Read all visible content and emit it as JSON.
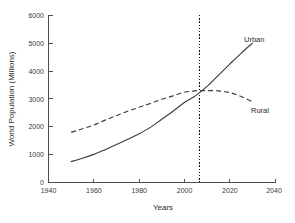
{
  "chart_data": {
    "type": "line",
    "title": "",
    "xlabel": "Years",
    "ylabel": "World Population (Millions)",
    "xlim": [
      1940,
      2040
    ],
    "ylim": [
      0,
      6000
    ],
    "xticks": [
      1940,
      1960,
      1980,
      2000,
      2020,
      2040
    ],
    "yticks": [
      0,
      1000,
      2000,
      3000,
      4000,
      5000,
      6000
    ],
    "grid": false,
    "legend_position": "inline-end-labels",
    "x": [
      1950,
      1955,
      1960,
      1965,
      1970,
      1975,
      1980,
      1985,
      1990,
      1995,
      2000,
      2005,
      2010,
      2015,
      2020,
      2025,
      2030
    ],
    "series": [
      {
        "name": "Urban",
        "style": "solid",
        "values": [
          750,
          870,
          1010,
          1180,
          1360,
          1550,
          1750,
          1980,
          2270,
          2560,
          2870,
          3120,
          3450,
          3850,
          4250,
          4640,
          5000
        ]
      },
      {
        "name": "Rural",
        "style": "dashed",
        "values": [
          1800,
          1930,
          2060,
          2240,
          2400,
          2560,
          2700,
          2840,
          2990,
          3110,
          3240,
          3290,
          3300,
          3290,
          3230,
          3090,
          2900
        ]
      }
    ],
    "annotations": [
      {
        "name": "crossover-marker",
        "type": "vertical-dotted-line",
        "x": 2008,
        "label": ""
      }
    ]
  },
  "labels": {
    "urban": "Urban",
    "rural": "Rural",
    "xlabel": "Years",
    "ylabel": "World Population (Millions)",
    "ytick_0": "0",
    "ytick_1000": "1000",
    "ytick_2000": "2000",
    "ytick_3000": "3000",
    "ytick_4000": "4000",
    "ytick_5000": "5000",
    "ytick_6000": "6000",
    "xtick_1940": "1940",
    "xtick_1960": "1960",
    "xtick_1980": "1980",
    "xtick_2000": "2000",
    "xtick_2020": "2020",
    "xtick_2040": "2040"
  },
  "colors": {
    "background": "#ffffff",
    "axis": "#4d4d4d",
    "line": "#3a3a3a",
    "marker": "#111111",
    "text": "#2b2b2b"
  }
}
